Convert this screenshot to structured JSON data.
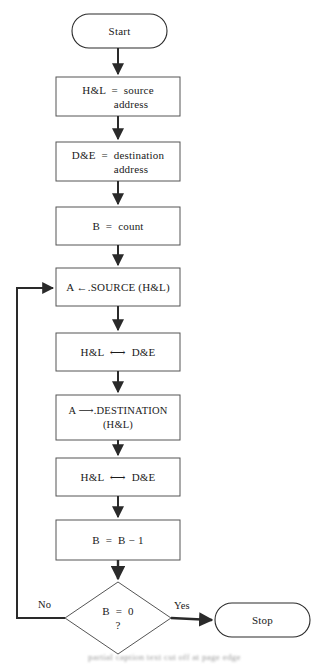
{
  "diagram": {
    "background_color": "#ffffff",
    "line_color": "#2a2a2a",
    "text_color": "#1a1a1a"
  },
  "nodes": {
    "start": {
      "type": "terminal",
      "label": "Start"
    },
    "set_source": {
      "type": "process",
      "line1": "H&L  =  source",
      "line2": "address"
    },
    "set_destination": {
      "type": "process",
      "line1": "D&E  =  destination",
      "line2": "address"
    },
    "set_count": {
      "type": "process",
      "line1": "B  =  count"
    },
    "load_source": {
      "type": "process",
      "line1": "A ←.SOURCE (H&L)"
    },
    "swap1": {
      "type": "process",
      "line1": "H&L  ⟷  D&E"
    },
    "store_destination": {
      "type": "process",
      "line1": "A ⟶.DESTINATION",
      "line2": "(H&L)"
    },
    "swap2": {
      "type": "process",
      "line1": "H&L  ⟷  D&E"
    },
    "decrement": {
      "type": "process",
      "line1": "B  =  B − 1"
    },
    "test_zero": {
      "type": "decision",
      "line1": "B  =  0",
      "line2": "?"
    },
    "stop": {
      "type": "terminal",
      "label": "Stop"
    }
  },
  "edge_labels": {
    "no": "No",
    "yes": "Yes"
  },
  "caption": {
    "text": "partial caption text cut off at page edge"
  }
}
